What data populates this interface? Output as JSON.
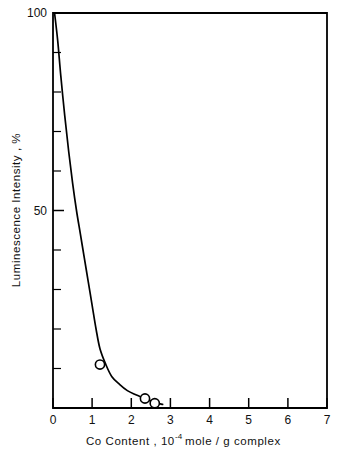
{
  "chart_data": {
    "type": "line",
    "title": "",
    "xlabel_parts": {
      "pre": "Co  Content ,  10",
      "sup": "-4",
      "post": "mole / g  complex"
    },
    "xlabel": "Co Content , 10-4 mole / g complex",
    "ylabel": "Luminescence  Intensity ,  %",
    "xlim": [
      0,
      7
    ],
    "ylim": [
      0,
      100
    ],
    "grid": false,
    "legend": null,
    "x_tick_labels": [
      "0",
      "1",
      "2",
      "3",
      "4",
      "5",
      "6",
      "7"
    ],
    "x_tick_values": [
      0,
      1,
      2,
      3,
      4,
      5,
      6,
      7
    ],
    "y_tick_labels": [
      "50",
      "100"
    ],
    "y_tick_values": [
      50,
      100
    ],
    "y_minor_ticks": [
      10,
      20,
      30,
      40,
      60,
      70,
      80,
      90
    ],
    "series": [
      {
        "name": "Luminescence quenching",
        "marker": "open-circle",
        "line_color": "#000000",
        "marker_points": [
          {
            "x": 1.2,
            "y": 11
          },
          {
            "x": 2.35,
            "y": 2.4
          },
          {
            "x": 2.6,
            "y": 1.2
          }
        ],
        "curve_points": [
          {
            "x": 0.04,
            "y": 100
          },
          {
            "x": 0.12,
            "y": 93
          },
          {
            "x": 0.2,
            "y": 84
          },
          {
            "x": 0.3,
            "y": 74
          },
          {
            "x": 0.4,
            "y": 65
          },
          {
            "x": 0.5,
            "y": 57
          },
          {
            "x": 0.6,
            "y": 50
          },
          {
            "x": 0.7,
            "y": 44
          },
          {
            "x": 0.8,
            "y": 38
          },
          {
            "x": 0.9,
            "y": 32
          },
          {
            "x": 1.0,
            "y": 26
          },
          {
            "x": 1.1,
            "y": 20
          },
          {
            "x": 1.2,
            "y": 15
          },
          {
            "x": 1.35,
            "y": 11
          },
          {
            "x": 1.5,
            "y": 8
          },
          {
            "x": 1.7,
            "y": 6
          },
          {
            "x": 1.9,
            "y": 4.4
          },
          {
            "x": 2.1,
            "y": 3.4
          },
          {
            "x": 2.35,
            "y": 2.4
          },
          {
            "x": 2.6,
            "y": 1.4
          },
          {
            "x": 2.8,
            "y": 0.9
          }
        ]
      }
    ]
  },
  "axes": {
    "x_tick_0": "0",
    "x_tick_1": "1",
    "x_tick_2": "2",
    "x_tick_3": "3",
    "x_tick_4": "4",
    "x_tick_5": "5",
    "x_tick_6": "6",
    "x_tick_7": "7",
    "y_tick_50": "50",
    "y_tick_100": "100"
  }
}
